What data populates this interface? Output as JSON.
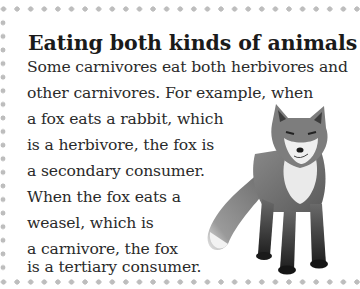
{
  "panel": {
    "title": "Eating both kinds of animals",
    "lines": [
      "Some carnivores eat both herbivores and",
      "other carnivores. For example, when",
      "a fox eats a rabbit, which",
      "is a herbivore, the fox is",
      "a secondary consumer.",
      "When the fox eats a",
      "weasel, which is",
      "a carnivore, the fox",
      "is a tertiary consumer."
    ],
    "illustration": "red-fox-standing"
  },
  "colors": {
    "dot_border": "#bdbdbd",
    "text": "#2a2a2a",
    "background": "#ffffff"
  }
}
